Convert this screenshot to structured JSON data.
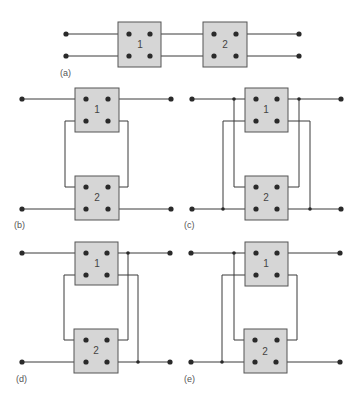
{
  "figure": {
    "panels": [
      {
        "id": "a",
        "label": "(a)",
        "configuration": "cascade",
        "boxes": [
          "1",
          "2"
        ]
      },
      {
        "id": "b",
        "label": "(b)",
        "configuration": "series-series",
        "boxes": [
          "1",
          "2"
        ]
      },
      {
        "id": "c",
        "label": "(c)",
        "configuration": "parallel-parallel",
        "boxes": [
          "1",
          "2"
        ]
      },
      {
        "id": "d",
        "label": "(d)",
        "configuration": "series-parallel",
        "boxes": [
          "1",
          "2"
        ]
      },
      {
        "id": "e",
        "label": "(e)",
        "configuration": "parallel-series",
        "boxes": [
          "1",
          "2"
        ]
      }
    ]
  },
  "colors": {
    "box_fill": "#d6d6d6",
    "box_stroke": "#555555",
    "wire": "#3a3a3a",
    "dot": "#2a2a2a"
  }
}
